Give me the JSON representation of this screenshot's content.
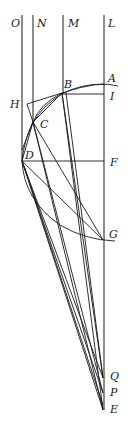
{
  "diagram": {
    "type": "geometric-construction",
    "labels": {
      "O": "O",
      "N": "N",
      "M": "M",
      "L": "L",
      "A": "A",
      "B": "B",
      "I": "I",
      "H": "H",
      "C": "C",
      "D": "D",
      "F": "F",
      "G": "G",
      "Q": "Q",
      "P": "P",
      "E": "E"
    },
    "points": {
      "A": [
        103,
        83
      ],
      "B": [
        62,
        93
      ],
      "I": [
        103,
        94
      ],
      "H": [
        27,
        104
      ],
      "C": [
        33,
        122
      ],
      "D": [
        22,
        161
      ],
      "F": [
        103,
        161
      ],
      "G": [
        103,
        240
      ],
      "Q": [
        103,
        378
      ],
      "P": [
        103,
        393
      ],
      "E": [
        103,
        410
      ]
    },
    "vertical_lines": [
      "O",
      "N",
      "M",
      "L"
    ],
    "color": "#1a1a1a"
  }
}
